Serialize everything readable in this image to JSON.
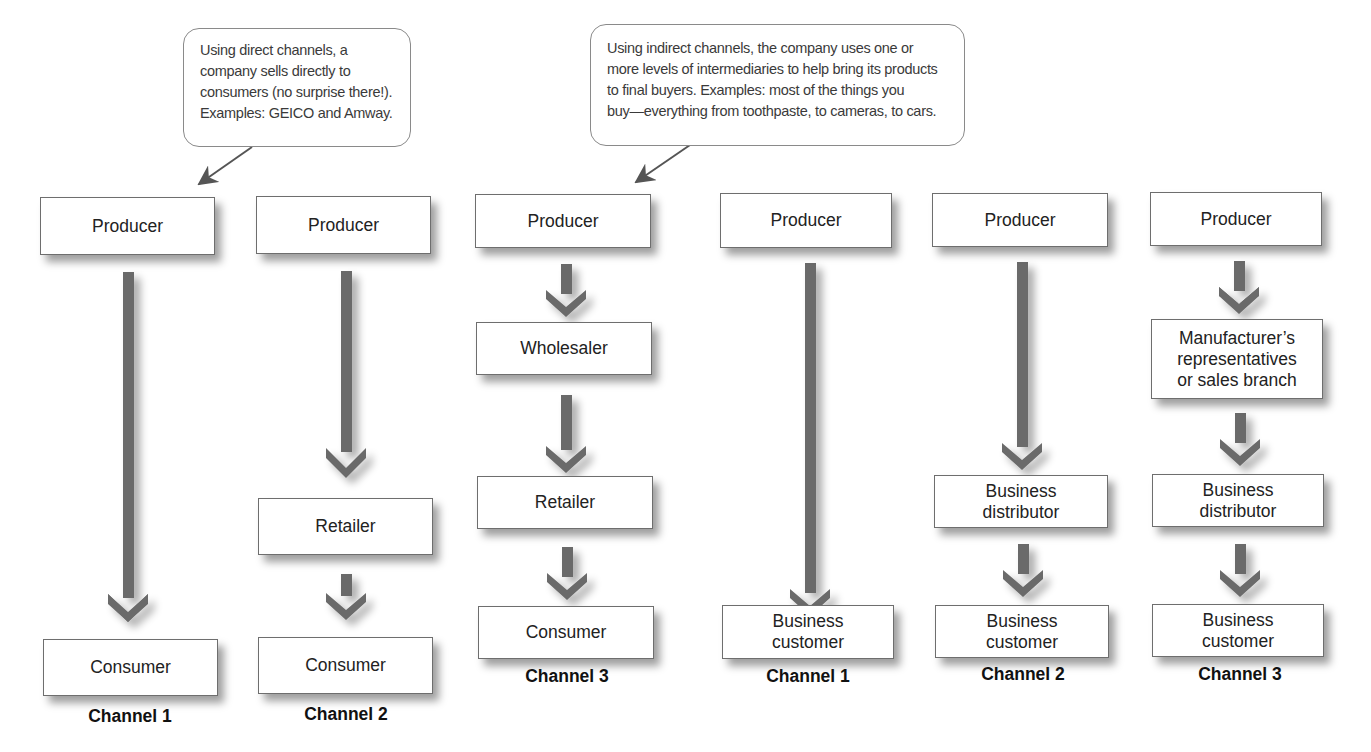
{
  "callouts": {
    "direct": {
      "lines": [
        "Using direct channels, a",
        "company sells directly to",
        "consumers (no surprise there!).",
        "Examples: GEICO and Amway."
      ]
    },
    "indirect": {
      "lines": [
        "Using indirect channels, the company uses one or",
        "more levels of intermediaries to help bring its products",
        "to final buyers. Examples: most of the things you",
        "buy—everything from toothpaste, to cameras, to cars."
      ]
    }
  },
  "consumer_channels": [
    {
      "label": "Channel 1",
      "nodes": [
        {
          "lines": [
            "Producer"
          ]
        },
        {
          "lines": [
            "Consumer"
          ]
        }
      ]
    },
    {
      "label": "Channel 2",
      "nodes": [
        {
          "lines": [
            "Producer"
          ]
        },
        {
          "lines": [
            "Retailer"
          ]
        },
        {
          "lines": [
            "Consumer"
          ]
        }
      ]
    },
    {
      "label": "Channel 3",
      "nodes": [
        {
          "lines": [
            "Producer"
          ]
        },
        {
          "lines": [
            "Wholesaler"
          ]
        },
        {
          "lines": [
            "Retailer"
          ]
        },
        {
          "lines": [
            "Consumer"
          ]
        }
      ]
    }
  ],
  "business_channels": [
    {
      "label": "Channel 1",
      "nodes": [
        {
          "lines": [
            "Producer"
          ]
        },
        {
          "lines": [
            "Business",
            "customer"
          ]
        }
      ]
    },
    {
      "label": "Channel 2",
      "nodes": [
        {
          "lines": [
            "Producer"
          ]
        },
        {
          "lines": [
            "Business",
            "distributor"
          ]
        },
        {
          "lines": [
            "Business",
            "customer"
          ]
        }
      ]
    },
    {
      "label": "Channel 3",
      "nodes": [
        {
          "lines": [
            "Producer"
          ]
        },
        {
          "lines": [
            "Manufacturer’s",
            "representatives",
            "or sales branch"
          ]
        },
        {
          "lines": [
            "Business",
            "distributor"
          ]
        },
        {
          "lines": [
            "Business",
            "customer"
          ]
        }
      ]
    }
  ],
  "colors": {
    "arrow": "#6b6b6b",
    "box_border": "#6e6e6e",
    "callout_border": "#8a8a8a",
    "background": "#ffffff"
  }
}
